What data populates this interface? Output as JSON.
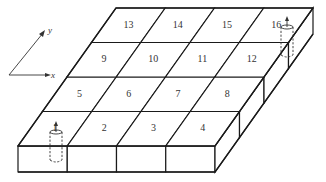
{
  "diagram": {
    "grid": {
      "columns": 4,
      "rows": 4
    },
    "cells": [
      {
        "label": "1",
        "col": 0,
        "row": 0
      },
      {
        "label": "2",
        "col": 1,
        "row": 0
      },
      {
        "label": "3",
        "col": 2,
        "row": 0
      },
      {
        "label": "4",
        "col": 3,
        "row": 0
      },
      {
        "label": "5",
        "col": 0,
        "row": 1
      },
      {
        "label": "6",
        "col": 1,
        "row": 1
      },
      {
        "label": "7",
        "col": 2,
        "row": 1
      },
      {
        "label": "8",
        "col": 3,
        "row": 1
      },
      {
        "label": "9",
        "col": 0,
        "row": 2
      },
      {
        "label": "10",
        "col": 1,
        "row": 2
      },
      {
        "label": "11",
        "col": 2,
        "row": 2
      },
      {
        "label": "12",
        "col": 3,
        "row": 2
      },
      {
        "label": "13",
        "col": 0,
        "row": 3
      },
      {
        "label": "14",
        "col": 1,
        "row": 3
      },
      {
        "label": "15",
        "col": 2,
        "row": 3
      },
      {
        "label": "16",
        "col": 3,
        "row": 3
      }
    ],
    "markers": [
      {
        "name": "cylinder-marker-1",
        "cell": "1"
      },
      {
        "name": "cylinder-marker-16",
        "cell": "16"
      }
    ],
    "axes": {
      "x_label": "x",
      "y_label": "y"
    },
    "colors": {
      "line": "#1a1a1a",
      "background": "#ffffff"
    }
  }
}
